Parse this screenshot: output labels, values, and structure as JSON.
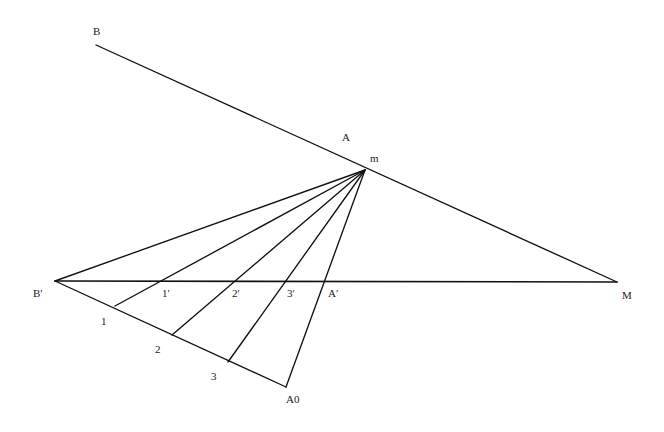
{
  "figure": {
    "type": "geometric-construction",
    "background_color": "#ffffff",
    "line_color": "#111111",
    "label_color": "#1a1a1a",
    "width": 664,
    "height": 432
  },
  "labels": {
    "B": "B",
    "A": "A",
    "m": "m",
    "B_prime": "B′",
    "M": "M",
    "A_prime": "A′",
    "one": "1",
    "two": "2",
    "three": "3",
    "one_prime": "1′",
    "two_prime": "2′",
    "three_prime": "3′",
    "A0": "A0"
  },
  "points": [
    {
      "name": "B",
      "label": "B",
      "x": 96,
      "y": 45,
      "label_x": 93,
      "label_y": 26
    },
    {
      "name": "A",
      "label": "A",
      "x": 352,
      "y": 163,
      "label_x": 342,
      "label_y": 132
    },
    {
      "name": "m",
      "label": "m",
      "x": 365,
      "y": 170,
      "label_x": 370,
      "label_y": 153
    },
    {
      "name": "B-prime",
      "label": "B′",
      "x": 55,
      "y": 281,
      "label_x": 33,
      "label_y": 288
    },
    {
      "name": "M",
      "label": "M",
      "x": 617,
      "y": 282,
      "label_x": 622,
      "label_y": 290
    },
    {
      "name": "one-prime",
      "label": "1′",
      "x": 157,
      "y": 281,
      "label_x": 162,
      "label_y": 288
    },
    {
      "name": "two-prime",
      "label": "2′",
      "x": 228,
      "y": 281,
      "label_x": 232,
      "label_y": 288
    },
    {
      "name": "three-prime",
      "label": "3′",
      "x": 283,
      "y": 281,
      "label_x": 287,
      "label_y": 288
    },
    {
      "name": "A-prime",
      "label": "A′",
      "x": 322,
      "y": 281,
      "label_x": 328,
      "label_y": 288
    },
    {
      "name": "one",
      "label": "1",
      "x": 115,
      "y": 306,
      "label_x": 101,
      "label_y": 316
    },
    {
      "name": "two",
      "label": "2",
      "x": 172,
      "y": 335,
      "label_x": 155,
      "label_y": 344
    },
    {
      "name": "three",
      "label": "3",
      "x": 228,
      "y": 362,
      "label_x": 211,
      "label_y": 371
    },
    {
      "name": "A0",
      "label": "A0",
      "x": 286,
      "y": 387,
      "label_x": 286,
      "label_y": 394
    }
  ],
  "segments": [
    {
      "name": "line-B-to-M",
      "x1": 96,
      "y1": 45,
      "x2": 617,
      "y2": 282
    },
    {
      "name": "baseline-Bprime-to-M",
      "x1": 55,
      "y1": 281,
      "x2": 617,
      "y2": 282
    },
    {
      "name": "ray-m-to-Bprime",
      "x1": 365,
      "y1": 170,
      "x2": 55,
      "y2": 281
    },
    {
      "name": "ray-m-to-1",
      "x1": 365,
      "y1": 170,
      "x2": 115,
      "y2": 306
    },
    {
      "name": "ray-m-to-2",
      "x1": 365,
      "y1": 170,
      "x2": 172,
      "y2": 335
    },
    {
      "name": "ray-m-to-3",
      "x1": 365,
      "y1": 170,
      "x2": 228,
      "y2": 362
    },
    {
      "name": "ray-m-to-A0",
      "x1": 365,
      "y1": 170,
      "x2": 286,
      "y2": 387
    },
    {
      "name": "chain-Bprime-to-A0",
      "x1": 55,
      "y1": 281,
      "x2": 286,
      "y2": 387
    }
  ],
  "chart_data": {
    "type": "scatter",
    "title": "",
    "xlabel": "",
    "ylabel": "",
    "vertices": {
      "B": [
        96,
        45
      ],
      "A": [
        352,
        163
      ],
      "m": [
        365,
        170
      ],
      "B_prime": [
        55,
        281
      ],
      "M": [
        617,
        282
      ],
      "A_prime": [
        322,
        281
      ],
      "one": [
        115,
        306
      ],
      "two": [
        172,
        335
      ],
      "three": [
        228,
        362
      ],
      "one_prime": [
        157,
        281
      ],
      "two_prime": [
        228,
        281
      ],
      "three_prime": [
        283,
        281
      ],
      "A0": [
        286,
        387
      ]
    },
    "edges": [
      [
        "B",
        "M"
      ],
      [
        "B_prime",
        "M"
      ],
      [
        "m",
        "B_prime"
      ],
      [
        "m",
        "one"
      ],
      [
        "m",
        "two"
      ],
      [
        "m",
        "three"
      ],
      [
        "m",
        "A0"
      ],
      [
        "B_prime",
        "A0"
      ]
    ],
    "grid": false,
    "legend": "none"
  }
}
